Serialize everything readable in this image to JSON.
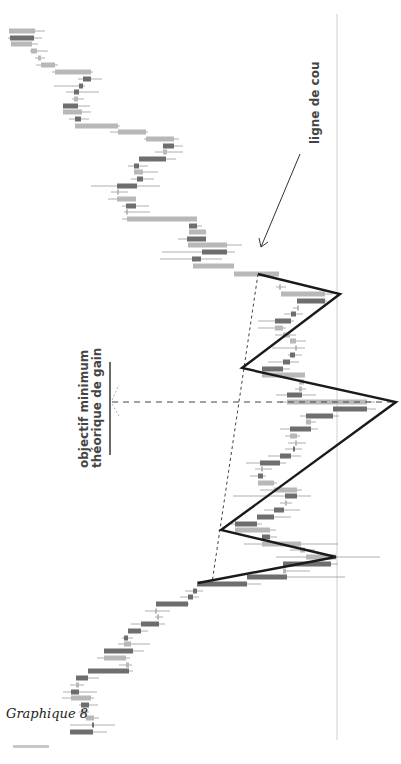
{
  "caption": "Graphique 8",
  "annotations": {
    "neckline_label": "ligne de cou",
    "target_label_line1": "objectif minimum",
    "target_label_line2": "théorique de gain"
  },
  "colors": {
    "bull": "#b8b8b8",
    "bear": "#6e6e6e",
    "wick": "#9a9a9a",
    "pattern": "#1a1a1a",
    "grid": "#cfcfcf",
    "dashed": "#444444"
  },
  "chart_data": {
    "type": "candlestick",
    "title": "Graphique 8",
    "orientation": "rotated 90° (time runs top→bottom, price runs horizontally)",
    "pattern": "tête-épaules (head and shoulders)",
    "annotations": [
      "ligne de cou",
      "objectif minimum théorique de gain"
    ],
    "reference_line_x": 337,
    "pattern_points": [
      [
        258,
        274
      ],
      [
        340,
        294
      ],
      [
        242,
        368
      ],
      [
        396,
        402
      ],
      [
        221,
        530
      ],
      [
        336,
        557
      ],
      [
        198,
        583
      ]
    ],
    "neckline": [
      [
        258,
        274
      ],
      [
        212,
        583
      ]
    ],
    "target_dashed_line": {
      "y": 402,
      "x_from": 112,
      "x_to": 395
    },
    "target_marker": {
      "x": 110,
      "y_from": 362,
      "y_to": 455
    },
    "candles": [
      {
        "y": 31,
        "o": 9,
        "c": 35,
        "lo": 9,
        "hi": 45,
        "t": "bull"
      },
      {
        "y": 38,
        "o": 10,
        "c": 34,
        "lo": 8,
        "hi": 42,
        "t": "bear"
      },
      {
        "y": 44,
        "o": 11,
        "c": 32,
        "lo": 11,
        "hi": 38,
        "t": "bull"
      },
      {
        "y": 51,
        "o": 31,
        "c": 37,
        "lo": 30,
        "hi": 48,
        "t": "bull"
      },
      {
        "y": 58,
        "o": 38,
        "c": 41,
        "lo": 35,
        "hi": 45,
        "t": "bull"
      },
      {
        "y": 65,
        "o": 41,
        "c": 55,
        "lo": 36,
        "hi": 58,
        "t": "bull"
      },
      {
        "y": 72,
        "o": 55,
        "c": 91,
        "lo": 52,
        "hi": 93,
        "t": "bull"
      },
      {
        "y": 79,
        "o": 83,
        "c": 91,
        "lo": 78,
        "hi": 102,
        "t": "bear"
      },
      {
        "y": 86,
        "o": 79,
        "c": 83,
        "lo": 54,
        "hi": 85,
        "t": "bear"
      },
      {
        "y": 92,
        "o": 74,
        "c": 79,
        "lo": 66,
        "hi": 99,
        "t": "bear"
      },
      {
        "y": 99,
        "o": 74,
        "c": 78,
        "lo": 72,
        "hi": 84,
        "t": "bull"
      },
      {
        "y": 106,
        "o": 63,
        "c": 78,
        "lo": 63,
        "hi": 90,
        "t": "bear"
      },
      {
        "y": 112,
        "o": 63,
        "c": 82,
        "lo": 63,
        "hi": 91,
        "t": "bull"
      },
      {
        "y": 119,
        "o": 75,
        "c": 81,
        "lo": 69,
        "hi": 89,
        "t": "bear"
      },
      {
        "y": 126,
        "o": 75,
        "c": 118,
        "lo": 75,
        "hi": 120,
        "t": "bull"
      },
      {
        "y": 132,
        "o": 118,
        "c": 146,
        "lo": 110,
        "hi": 148,
        "t": "bull"
      },
      {
        "y": 139,
        "o": 146,
        "c": 174,
        "lo": 144,
        "hi": 179,
        "t": "bull"
      },
      {
        "y": 146,
        "o": 163,
        "c": 174,
        "lo": 163,
        "hi": 183,
        "t": "bear"
      },
      {
        "y": 152,
        "o": 163,
        "c": 167,
        "lo": 155,
        "hi": 183,
        "t": "bull"
      },
      {
        "y": 159,
        "o": 139,
        "c": 166,
        "lo": 139,
        "hi": 176,
        "t": "bear"
      },
      {
        "y": 166,
        "o": 134,
        "c": 139,
        "lo": 128,
        "hi": 148,
        "t": "bear"
      },
      {
        "y": 172,
        "o": 134,
        "c": 143,
        "lo": 134,
        "hi": 158,
        "t": "bull"
      },
      {
        "y": 179,
        "o": 137,
        "c": 143,
        "lo": 131,
        "hi": 154,
        "t": "bear"
      },
      {
        "y": 186,
        "o": 117,
        "c": 137,
        "lo": 91,
        "hi": 160,
        "t": "bear"
      },
      {
        "y": 192,
        "o": 117,
        "c": 118,
        "lo": 111,
        "hi": 128,
        "t": "bull"
      },
      {
        "y": 199,
        "o": 117,
        "c": 136,
        "lo": 108,
        "hi": 136,
        "t": "bull"
      },
      {
        "y": 206,
        "o": 126,
        "c": 136,
        "lo": 122,
        "hi": 149,
        "t": "bear"
      },
      {
        "y": 212,
        "o": 126,
        "c": 128,
        "lo": 124,
        "hi": 150,
        "t": "bull"
      },
      {
        "y": 219,
        "o": 127,
        "c": 197,
        "lo": 122,
        "hi": 197,
        "t": "bull"
      },
      {
        "y": 226,
        "o": 189,
        "c": 197,
        "lo": 189,
        "hi": 202,
        "t": "bear"
      },
      {
        "y": 232,
        "o": 189,
        "c": 206,
        "lo": 189,
        "hi": 206,
        "t": "bull"
      },
      {
        "y": 239,
        "o": 187,
        "c": 206,
        "lo": 178,
        "hi": 206,
        "t": "bear"
      },
      {
        "y": 245,
        "o": 188,
        "c": 227,
        "lo": 188,
        "hi": 242,
        "t": "bull"
      },
      {
        "y": 252,
        "o": 202,
        "c": 227,
        "lo": 162,
        "hi": 235,
        "t": "bear"
      },
      {
        "y": 259,
        "o": 192,
        "c": 201,
        "lo": 160,
        "hi": 222,
        "t": "bear"
      },
      {
        "y": 266,
        "o": 193,
        "c": 234,
        "lo": 193,
        "hi": 234,
        "t": "bull"
      },
      {
        "y": 274,
        "o": 234,
        "c": 279,
        "lo": 234,
        "hi": 279,
        "t": "bull"
      },
      {
        "y": 287,
        "o": 279,
        "c": 280,
        "lo": 276,
        "hi": 286,
        "t": "bull"
      },
      {
        "y": 294,
        "o": 281,
        "c": 325,
        "lo": 281,
        "hi": 333,
        "t": "bull"
      },
      {
        "y": 301,
        "o": 297,
        "c": 325,
        "lo": 297,
        "hi": 327,
        "t": "bear"
      },
      {
        "y": 308,
        "o": 297,
        "c": 298,
        "lo": 293,
        "hi": 299,
        "t": "bull"
      },
      {
        "y": 314,
        "o": 291,
        "c": 296,
        "lo": 284,
        "hi": 303,
        "t": "bear"
      },
      {
        "y": 321,
        "o": 275,
        "c": 291,
        "lo": 258,
        "hi": 294,
        "t": "bear"
      },
      {
        "y": 328,
        "o": 275,
        "c": 283,
        "lo": 258,
        "hi": 286,
        "t": "bull"
      },
      {
        "y": 335,
        "o": 283,
        "c": 290,
        "lo": 275,
        "hi": 296,
        "t": "bull"
      },
      {
        "y": 341,
        "o": 290,
        "c": 296,
        "lo": 290,
        "hi": 306,
        "t": "bull"
      },
      {
        "y": 348,
        "o": 295,
        "c": 296,
        "lo": 272,
        "hi": 305,
        "t": "bull"
      },
      {
        "y": 355,
        "o": 290,
        "c": 295,
        "lo": 288,
        "hi": 302,
        "t": "bear"
      },
      {
        "y": 362,
        "o": 283,
        "c": 290,
        "lo": 268,
        "hi": 299,
        "t": "bear"
      },
      {
        "y": 369,
        "o": 262,
        "c": 283,
        "lo": 262,
        "hi": 290,
        "t": "bear"
      },
      {
        "y": 375,
        "o": 262,
        "c": 305,
        "lo": 262,
        "hi": 305,
        "t": "bull"
      },
      {
        "y": 382,
        "o": 299,
        "c": 304,
        "lo": 299,
        "hi": 306,
        "t": "bull"
      },
      {
        "y": 389,
        "o": 299,
        "c": 302,
        "lo": 295,
        "hi": 306,
        "t": "bull"
      },
      {
        "y": 395,
        "o": 287,
        "c": 302,
        "lo": 276,
        "hi": 316,
        "t": "bear"
      },
      {
        "y": 402,
        "o": 287,
        "c": 367,
        "lo": 280,
        "hi": 375,
        "t": "bull"
      },
      {
        "y": 409,
        "o": 333,
        "c": 367,
        "lo": 333,
        "hi": 376,
        "t": "bear"
      },
      {
        "y": 416,
        "o": 306,
        "c": 333,
        "lo": 300,
        "hi": 339,
        "t": "bear"
      },
      {
        "y": 422,
        "o": 306,
        "c": 311,
        "lo": 306,
        "hi": 316,
        "t": "bull"
      },
      {
        "y": 429,
        "o": 290,
        "c": 311,
        "lo": 280,
        "hi": 318,
        "t": "bear"
      },
      {
        "y": 436,
        "o": 290,
        "c": 297,
        "lo": 285,
        "hi": 300,
        "t": "bull"
      },
      {
        "y": 443,
        "o": 295,
        "c": 296,
        "lo": 288,
        "hi": 306,
        "t": "bull"
      },
      {
        "y": 449,
        "o": 293,
        "c": 295,
        "lo": 285,
        "hi": 302,
        "t": "bear"
      },
      {
        "y": 456,
        "o": 280,
        "c": 291,
        "lo": 268,
        "hi": 301,
        "t": "bear"
      },
      {
        "y": 463,
        "o": 260,
        "c": 280,
        "lo": 246,
        "hi": 286,
        "t": "bear"
      },
      {
        "y": 469,
        "o": 261,
        "c": 263,
        "lo": 255,
        "hi": 272,
        "t": "bull"
      },
      {
        "y": 476,
        "o": 258,
        "c": 263,
        "lo": 250,
        "hi": 266,
        "t": "bear"
      },
      {
        "y": 483,
        "o": 258,
        "c": 274,
        "lo": 258,
        "hi": 277,
        "t": "bull"
      },
      {
        "y": 490,
        "o": 274,
        "c": 297,
        "lo": 260,
        "hi": 302,
        "t": "bull"
      },
      {
        "y": 496,
        "o": 285,
        "c": 297,
        "lo": 233,
        "hi": 311,
        "t": "bear"
      },
      {
        "y": 503,
        "o": 285,
        "c": 287,
        "lo": 280,
        "hi": 292,
        "t": "bull"
      },
      {
        "y": 510,
        "o": 274,
        "c": 284,
        "lo": 264,
        "hi": 300,
        "t": "bear"
      },
      {
        "y": 517,
        "o": 257,
        "c": 274,
        "lo": 257,
        "hi": 291,
        "t": "bear"
      },
      {
        "y": 524,
        "o": 235,
        "c": 257,
        "lo": 231,
        "hi": 262,
        "t": "bear"
      },
      {
        "y": 530,
        "o": 235,
        "c": 270,
        "lo": 235,
        "hi": 276,
        "t": "bull"
      },
      {
        "y": 537,
        "o": 262,
        "c": 270,
        "lo": 262,
        "hi": 277,
        "t": "bear"
      },
      {
        "y": 544,
        "o": 262,
        "c": 301,
        "lo": 244,
        "hi": 338,
        "t": "bull"
      },
      {
        "y": 550,
        "o": 300,
        "c": 305,
        "lo": 290,
        "hi": 315,
        "t": "bull"
      },
      {
        "y": 557,
        "o": 306,
        "c": 336,
        "lo": 276,
        "hi": 380,
        "t": "bull"
      },
      {
        "y": 564,
        "o": 283,
        "c": 331,
        "lo": 283,
        "hi": 338,
        "t": "bear"
      },
      {
        "y": 571,
        "o": 283,
        "c": 286,
        "lo": 283,
        "hi": 310,
        "t": "bull"
      },
      {
        "y": 577,
        "o": 247,
        "c": 287,
        "lo": 247,
        "hi": 345,
        "t": "bear"
      },
      {
        "y": 584,
        "o": 197,
        "c": 247,
        "lo": 197,
        "hi": 261,
        "t": "bear"
      },
      {
        "y": 591,
        "o": 193,
        "c": 197,
        "lo": 185,
        "hi": 203,
        "t": "bear"
      },
      {
        "y": 597,
        "o": 188,
        "c": 193,
        "lo": 180,
        "hi": 199,
        "t": "bear"
      },
      {
        "y": 604,
        "o": 156,
        "c": 188,
        "lo": 156,
        "hi": 189,
        "t": "bear"
      },
      {
        "y": 611,
        "o": 155,
        "c": 156,
        "lo": 145,
        "hi": 170,
        "t": "bull"
      },
      {
        "y": 617,
        "o": 157,
        "c": 158,
        "lo": 155,
        "hi": 163,
        "t": "bull"
      },
      {
        "y": 624,
        "o": 141,
        "c": 159,
        "lo": 131,
        "hi": 165,
        "t": "bear"
      },
      {
        "y": 631,
        "o": 128,
        "c": 141,
        "lo": 128,
        "hi": 148,
        "t": "bear"
      },
      {
        "y": 638,
        "o": 124,
        "c": 128,
        "lo": 122,
        "hi": 133,
        "t": "bear"
      },
      {
        "y": 644,
        "o": 124,
        "c": 131,
        "lo": 118,
        "hi": 150,
        "t": "bull"
      },
      {
        "y": 651,
        "o": 104,
        "c": 133,
        "lo": 104,
        "hi": 144,
        "t": "bear"
      },
      {
        "y": 658,
        "o": 104,
        "c": 126,
        "lo": 97,
        "hi": 130,
        "t": "bull"
      },
      {
        "y": 665,
        "o": 126,
        "c": 129,
        "lo": 119,
        "hi": 132,
        "t": "bull"
      },
      {
        "y": 671,
        "o": 88,
        "c": 129,
        "lo": 88,
        "hi": 133,
        "t": "bear"
      },
      {
        "y": 678,
        "o": 76,
        "c": 88,
        "lo": 76,
        "hi": 99,
        "t": "bear"
      },
      {
        "y": 685,
        "o": 76,
        "c": 79,
        "lo": 70,
        "hi": 84,
        "t": "bull"
      },
      {
        "y": 692,
        "o": 71,
        "c": 79,
        "lo": 63,
        "hi": 97,
        "t": "bear"
      },
      {
        "y": 698,
        "o": 71,
        "c": 91,
        "lo": 62,
        "hi": 94,
        "t": "bull"
      },
      {
        "y": 705,
        "o": 81,
        "c": 89,
        "lo": 79,
        "hi": 98,
        "t": "bear"
      },
      {
        "y": 712,
        "o": 81,
        "c": 86,
        "lo": 79,
        "hi": 89,
        "t": "bull"
      },
      {
        "y": 718,
        "o": 86,
        "c": 94,
        "lo": 85,
        "hi": 99,
        "t": "bull"
      },
      {
        "y": 725,
        "o": 92,
        "c": 94,
        "lo": 70,
        "hi": 115,
        "t": "bear"
      },
      {
        "y": 732,
        "o": 70,
        "c": 93,
        "lo": 70,
        "hi": 107,
        "t": "bear"
      }
    ]
  }
}
